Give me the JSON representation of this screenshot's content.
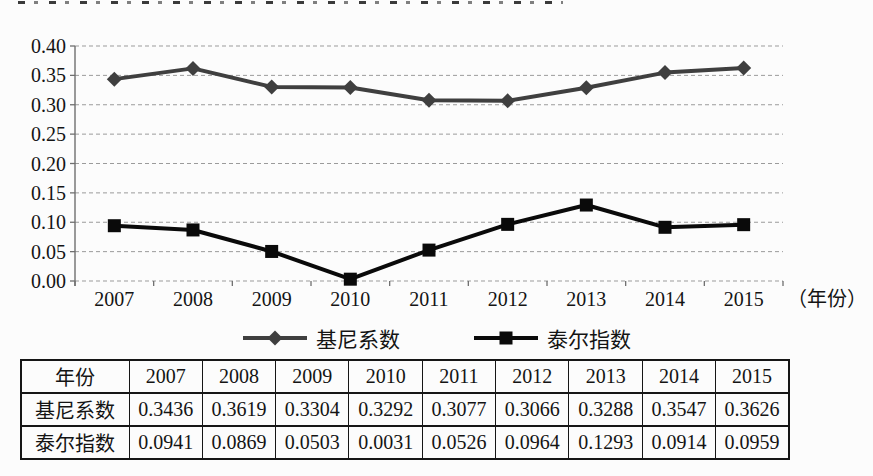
{
  "chart_data": {
    "type": "line",
    "categories": [
      "2007",
      "2008",
      "2009",
      "2010",
      "2011",
      "2012",
      "2013",
      "2014",
      "2015"
    ],
    "series": [
      {
        "name": "基尼系数",
        "marker": "diamond",
        "color": "#3f3f3f",
        "values": [
          0.3436,
          0.3619,
          0.3304,
          0.3292,
          0.3077,
          0.3066,
          0.3288,
          0.3547,
          0.3626
        ]
      },
      {
        "name": "泰尔指数",
        "marker": "square",
        "color": "#0a0a0a",
        "values": [
          0.0941,
          0.0869,
          0.0503,
          0.0031,
          0.0526,
          0.0964,
          0.1293,
          0.0914,
          0.0959
        ]
      }
    ],
    "title": "",
    "xlabel": "（年份）",
    "ylabel": "",
    "ylim": [
      0,
      0.4
    ],
    "ytick_step": 0.05,
    "ytick_labels": [
      "0.40",
      "0.35",
      "0.30",
      "0.25",
      "0.20",
      "0.15",
      "0.10",
      "0.05",
      "0.00"
    ],
    "grid": "horizontal-dashed",
    "gridline_color": "#9b9b9b",
    "axis_color": "#6f6f6f",
    "legend_position": "bottom"
  },
  "table": {
    "header_row": [
      "年份",
      "2007",
      "2008",
      "2009",
      "2010",
      "2011",
      "2012",
      "2013",
      "2014",
      "2015"
    ],
    "rows": [
      {
        "label": "基尼系数",
        "values": [
          "0.3436",
          "0.3619",
          "0.3304",
          "0.3292",
          "0.3077",
          "0.3066",
          "0.3288",
          "0.3547",
          "0.3626"
        ]
      },
      {
        "label": "泰尔指数",
        "values": [
          "0.0941",
          "0.0869",
          "0.0503",
          "0.0031",
          "0.0526",
          "0.0964",
          "0.1293",
          "0.0914",
          "0.0959"
        ]
      }
    ]
  }
}
